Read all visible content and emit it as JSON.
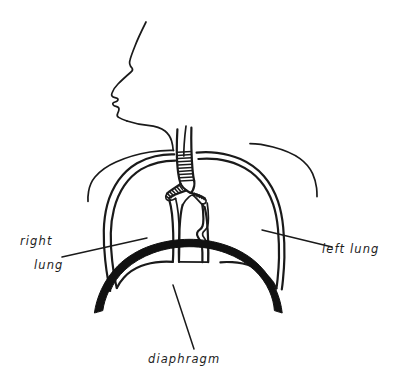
{
  "figure": {
    "background_color": "#ffffff",
    "ink_color": "#1a1a1a",
    "diaphragm_color": "#111111"
  },
  "labels": {
    "right_lung": {
      "line1": "right",
      "line2": "lung"
    },
    "left_lung": {
      "line1": "left lung"
    },
    "diaphragm": {
      "line1": "diaphragm"
    }
  },
  "parts": [
    {
      "name": "head-profile",
      "label": ""
    },
    {
      "name": "neck",
      "label": ""
    },
    {
      "name": "shoulder-left",
      "label": ""
    },
    {
      "name": "shoulder-right",
      "label": ""
    },
    {
      "name": "trachea",
      "label": ""
    },
    {
      "name": "bronchus-right",
      "label": ""
    },
    {
      "name": "bronchus-left",
      "label": ""
    },
    {
      "name": "right-lung",
      "label": "right lung"
    },
    {
      "name": "left-lung",
      "label": "left lung"
    },
    {
      "name": "mediastinum",
      "label": ""
    },
    {
      "name": "diaphragm",
      "label": "diaphragm"
    }
  ],
  "footer": {
    "ghost_line": ""
  }
}
